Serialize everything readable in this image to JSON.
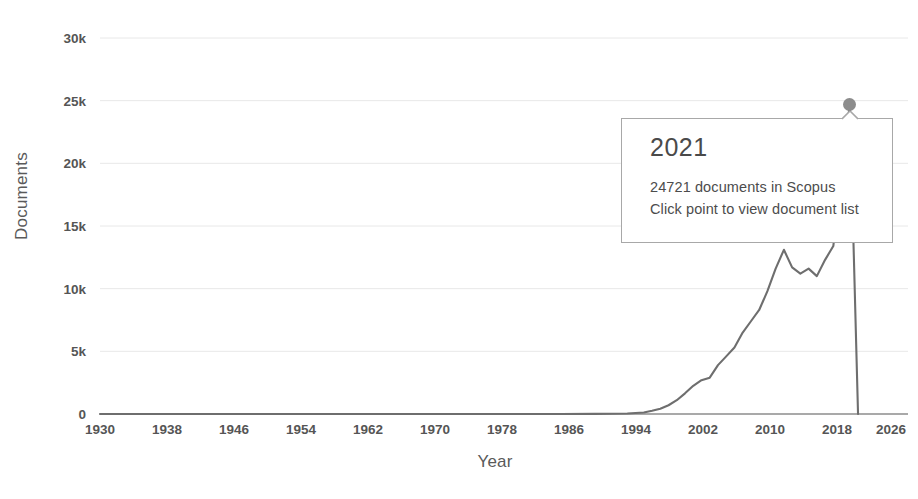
{
  "chart_data": {
    "type": "line",
    "title": "",
    "xlabel": "Year",
    "ylabel": "Documents",
    "xlim": [
      1930,
      2026
    ],
    "ylim": [
      0,
      30000
    ],
    "grid": true,
    "legend": false,
    "x_ticks": [
      "1930",
      "1938",
      "1946",
      "1954",
      "1962",
      "1970",
      "1978",
      "1986",
      "1994",
      "2002",
      "2010",
      "2018",
      "2026"
    ],
    "y_ticks": [
      "0",
      "5k",
      "10k",
      "15k",
      "20k",
      "25k",
      "30k"
    ],
    "y_tick_values": [
      0,
      5000,
      10000,
      15000,
      20000,
      25000,
      30000
    ],
    "series": [
      {
        "name": "documents",
        "color": "#6e6e6e",
        "x": [
          1930,
          1938,
          1946,
          1954,
          1962,
          1970,
          1978,
          1986,
          1990,
          1994,
          1996,
          1997,
          1998,
          1999,
          2000,
          2001,
          2002,
          2003,
          2004,
          2005,
          2006,
          2007,
          2008,
          2009,
          2010,
          2011,
          2012,
          2013,
          2014,
          2015,
          2016,
          2017,
          2018,
          2019,
          2020,
          2021,
          2022
        ],
        "values": [
          0,
          0,
          0,
          0,
          0,
          0,
          0,
          0,
          10,
          40,
          120,
          260,
          420,
          700,
          1100,
          1650,
          2250,
          2700,
          2900,
          3900,
          4600,
          5300,
          6500,
          7400,
          8300,
          9800,
          11600,
          13100,
          11700,
          11200,
          11600,
          11000,
          12300,
          13400,
          19000,
          24721,
          0
        ]
      }
    ],
    "highlight_point": {
      "year": "2021",
      "value": 24721
    }
  },
  "tooltip": {
    "title": "2021",
    "line1": "24721 documents in Scopus",
    "line2": "Click point to view document list"
  },
  "axes": {
    "y_title": "Documents",
    "x_title": "Year"
  },
  "colors": {
    "line": "#6e6e6e",
    "grid": "#e8e8e8",
    "axis": "#8c8c8c",
    "marker": "#8c8c8c",
    "text": "#555555",
    "tooltip_border": "#a8a8a8"
  }
}
